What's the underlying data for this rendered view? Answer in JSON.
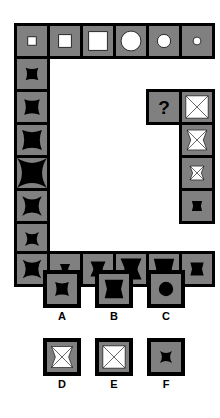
{
  "puzzle": {
    "title": "Matrix reasoning puzzle with missing element",
    "question_mark": "?",
    "grid": {
      "cell_bg": "#808080",
      "border_color": "#000000",
      "shape_white": "#ffffff",
      "shape_black": "#000000"
    },
    "top_row": [
      {
        "name": "cell-top-1",
        "shape": "square",
        "fill": "white",
        "size": 0.28
      },
      {
        "name": "cell-top-2",
        "shape": "square",
        "fill": "white",
        "size": 0.42
      },
      {
        "name": "cell-top-3",
        "shape": "square",
        "fill": "white",
        "size": 0.62
      },
      {
        "name": "cell-top-4",
        "shape": "circle",
        "fill": "white",
        "size": 0.66
      },
      {
        "name": "cell-top-5",
        "shape": "circle",
        "fill": "white",
        "size": 0.44
      },
      {
        "name": "cell-top-6",
        "shape": "circle",
        "fill": "white",
        "size": 0.26
      }
    ],
    "left_column": [
      {
        "name": "cell-left-1",
        "shape": "star-square",
        "fill": "black",
        "size": 0.42
      },
      {
        "name": "cell-left-2",
        "shape": "star-square",
        "fill": "black",
        "size": 0.52
      },
      {
        "name": "cell-left-3",
        "shape": "star-square",
        "fill": "black",
        "size": 0.66
      },
      {
        "name": "cell-left-4",
        "shape": "star-circle",
        "fill": "black",
        "size": 0.64
      },
      {
        "name": "cell-left-5",
        "shape": "star-circle",
        "fill": "black",
        "size": 0.42
      },
      {
        "name": "cell-left-6",
        "shape": "star-circle",
        "fill": "black",
        "size": 0.3
      }
    ],
    "bottom_row": [
      {
        "name": "cell-bottom-1",
        "shape": "star-circle",
        "fill": "black",
        "size": 0.4
      },
      {
        "name": "cell-bottom-2",
        "shape": "bowtie-circle",
        "fill": "black",
        "size": 0.34
      },
      {
        "name": "cell-bottom-3",
        "shape": "bowtie-circle",
        "fill": "black",
        "size": 0.5
      },
      {
        "name": "cell-bottom-4",
        "shape": "bowtie-circle",
        "fill": "black",
        "size": 0.7
      },
      {
        "name": "cell-bottom-5",
        "shape": "bowtie-square",
        "fill": "black",
        "size": 0.68
      },
      {
        "name": "cell-bottom-6",
        "shape": "bowtie-square",
        "fill": "black",
        "size": 0.44
      }
    ],
    "right_column": [
      {
        "name": "cell-right-1",
        "shape": "x-square",
        "fill": "white",
        "size": 0.74
      },
      {
        "name": "cell-right-2",
        "shape": "x-bowtie",
        "fill": "white",
        "size": 0.66
      },
      {
        "name": "cell-right-3",
        "shape": "x-bowtie",
        "fill": "white",
        "size": 0.46
      },
      {
        "name": "cell-right-4",
        "shape": "bowtie-square",
        "fill": "black",
        "size": 0.34
      }
    ]
  },
  "options": [
    {
      "label": "A",
      "name": "option-a",
      "shape": "star-square",
      "fill": "black",
      "size": 0.46
    },
    {
      "label": "B",
      "name": "option-b",
      "shape": "bowtie-square",
      "fill": "black",
      "size": 0.62
    },
    {
      "label": "C",
      "name": "option-c",
      "shape": "circle",
      "fill": "black",
      "size": 0.48
    },
    {
      "label": "D",
      "name": "option-d",
      "shape": "x-bowtie",
      "fill": "white",
      "size": 0.7
    },
    {
      "label": "E",
      "name": "option-e",
      "shape": "x-square",
      "fill": "white",
      "size": 0.74
    },
    {
      "label": "F",
      "name": "option-f",
      "shape": "star-circle",
      "fill": "black",
      "size": 0.26
    }
  ]
}
